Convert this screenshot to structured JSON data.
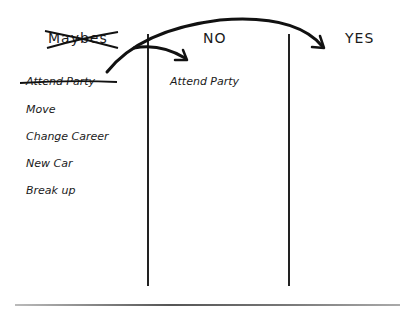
{
  "columns": {
    "maybes": {
      "header": "Maybes",
      "header_crossed_out": true,
      "items": [
        {
          "label": "Attend Party",
          "crossed_out": true
        },
        {
          "label": "Move",
          "crossed_out": false
        },
        {
          "label": "Change Career",
          "crossed_out": false
        },
        {
          "label": "New Car",
          "crossed_out": false
        },
        {
          "label": "Break up",
          "crossed_out": false
        }
      ]
    },
    "no": {
      "header": "NO",
      "items": [
        {
          "label": "Attend Party"
        }
      ]
    },
    "yes": {
      "header": "YES",
      "items": []
    }
  },
  "arrows": [
    {
      "from": "maybes",
      "to": "no",
      "label": ""
    },
    {
      "from": "maybes",
      "to": "yes",
      "label": ""
    }
  ],
  "colors": {
    "ink": "#1a1a1a",
    "background": "#ffffff",
    "baseline": "#888888"
  }
}
